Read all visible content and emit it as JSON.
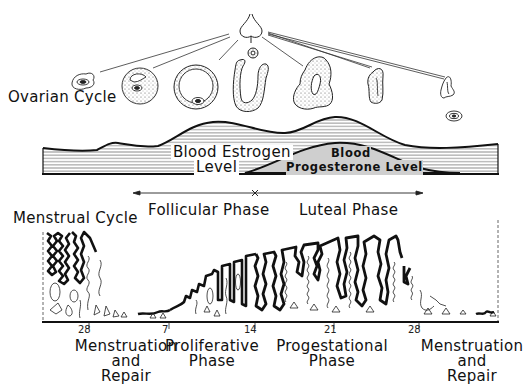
{
  "ovarian_cycle": {
    "title": "Ovarian Cycle",
    "stages": [
      {
        "name": "primordial-follicle"
      },
      {
        "name": "growing-follicle"
      },
      {
        "name": "mature-follicle"
      },
      {
        "name": "ruptured-follicle"
      },
      {
        "name": "corpus-luteum"
      },
      {
        "name": "regressing-corpus-luteum"
      },
      {
        "name": "corpus-albicans"
      }
    ]
  },
  "hormones": {
    "estrogen_label_line1": "Blood Estrogen",
    "estrogen_label_line2": "Level",
    "progesterone_label_line1": "Blood",
    "progesterone_label_line2": "Progesterone Level"
  },
  "phases": {
    "follicular": "Follicular Phase",
    "luteal": "Luteal Phase"
  },
  "menstrual_cycle": {
    "title": "Menstrual Cycle",
    "day_ticks": [
      "28",
      "7",
      "14",
      "21",
      "28"
    ],
    "stage_labels": [
      {
        "line1": "Menstruation",
        "line2": "and",
        "line3": "Repair"
      },
      {
        "line1": "Proliferative",
        "line2": "Phase"
      },
      {
        "line1": "Progestational",
        "line2": "Phase"
      },
      {
        "line1": "Menstruation",
        "line2": "and",
        "line3": "Repair"
      }
    ]
  },
  "colors": {
    "ink": "#111111",
    "progesterone_fill": "#cfcfcf",
    "hatch": "#555555",
    "background": "#ffffff"
  }
}
